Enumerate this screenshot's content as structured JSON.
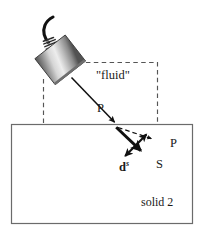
{
  "figure": {
    "title_absent": true,
    "labels": {
      "fluid": "\"fluid\"",
      "p_incident": "P",
      "p_refracted": "P",
      "s_wave": "S",
      "ds_base": "d",
      "ds_superscript": "s",
      "solid2": "solid 2"
    },
    "colors": {
      "line": "#1a1a1a",
      "dashed": "#5a5a5a",
      "box_border": "#6b6b6b",
      "background": "#ffffff",
      "transducer_light": "#f2f2f2",
      "transducer_mid": "#a8a8a8",
      "transducer_dark": "#4d4d4d",
      "cable": "#111111"
    },
    "geometry": {
      "solid_box": {
        "x": 11,
        "y": 124,
        "width": 182,
        "height": 100
      },
      "fluid_dashed_region": {
        "left_x": 43,
        "top_y": 62,
        "right_x": 157,
        "bottom_y": 124
      },
      "interface_point": {
        "x": 116,
        "y": 125
      },
      "incident_ray": {
        "x1": 72,
        "y1": 78,
        "x2": 116,
        "y2": 124
      },
      "refracted_p_ray": {
        "x1": 117,
        "y1": 127,
        "x2": 154,
        "y2": 140,
        "style": "dashed"
      },
      "refracted_s_ray": {
        "x1": 116,
        "y1": 127,
        "x2": 143,
        "y2": 153,
        "style": "solid-thick"
      },
      "displacement_arrow": {
        "x1": 148,
        "y1": 133,
        "x2": 123,
        "y2": 158,
        "style": "double-headed"
      },
      "transducer": {
        "center_x": 58,
        "center_y": 58,
        "width": 40,
        "height": 34,
        "rotation_deg": -38
      }
    },
    "elements": {
      "transducer": "ultrasonic-transducer",
      "cable": "coaxial-cable",
      "coil": "strain-relief-coil"
    }
  }
}
